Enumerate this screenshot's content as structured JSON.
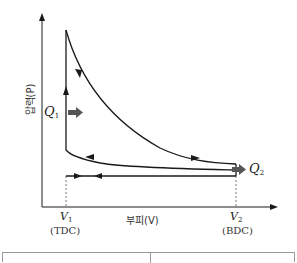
{
  "diagram": {
    "y_axis_label": "압력(P)",
    "x_axis_label": "부피(V)",
    "points": {
      "v1": {
        "symbol": "V",
        "subscript": "1",
        "desc": "(TDC)"
      },
      "v2": {
        "symbol": "V",
        "subscript": "2",
        "desc": "(BDC)"
      }
    },
    "heat": {
      "q_in": {
        "symbol": "Q",
        "subscript": "1"
      },
      "q_out": {
        "symbol": "Q",
        "subscript": "2"
      }
    },
    "colors": {
      "line": "#1a1a1a",
      "heat_arrow": "#555555",
      "dashed": "#555555"
    }
  },
  "table": {
    "columns": [
      "",
      ""
    ]
  }
}
